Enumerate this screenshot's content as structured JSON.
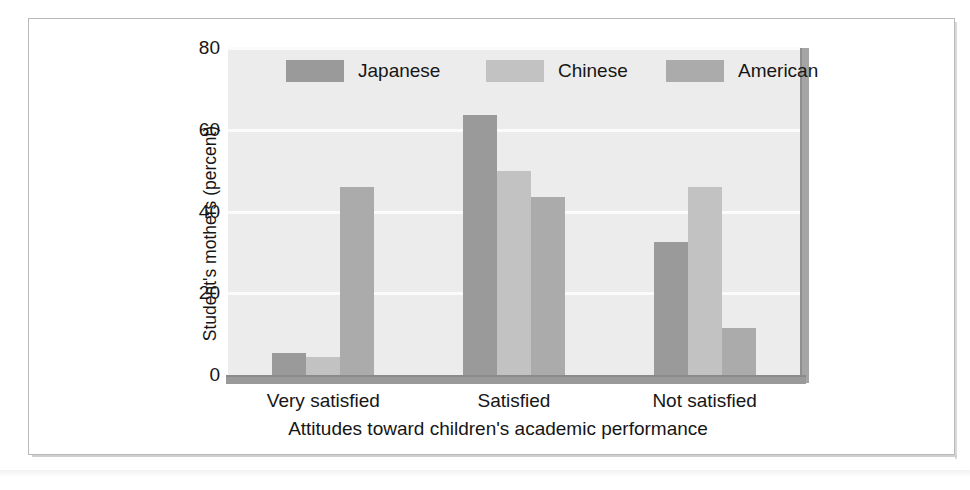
{
  "chart_data": {
    "type": "bar",
    "title": "",
    "xlabel": "Attitudes toward children's academic performance",
    "ylabel": "Student's mothers (percent)",
    "categories": [
      "Very satisfied",
      "Satisfied",
      "Not satisfied"
    ],
    "series": [
      {
        "name": "Japanese",
        "color": "#9a9a9a",
        "values": [
          5.5,
          63.5,
          32.5
        ]
      },
      {
        "name": "Chinese",
        "color": "#c2c2c2",
        "values": [
          4.5,
          50.0,
          46.0
        ]
      },
      {
        "name": "American",
        "color": "#ababab",
        "values": [
          46.0,
          43.5,
          11.5
        ]
      }
    ],
    "ylim": [
      0,
      80
    ],
    "yticks": [
      0,
      20,
      40,
      60,
      80
    ],
    "ytick_labels": [
      "0",
      "20",
      "40",
      "60",
      "80"
    ],
    "grid": "horizontal",
    "legend_position": "inside-top",
    "panel_color": "#ececec",
    "gridline_color": "#fbfbfb",
    "axis_color": "#9a9a9a",
    "text_color": "#161616"
  }
}
